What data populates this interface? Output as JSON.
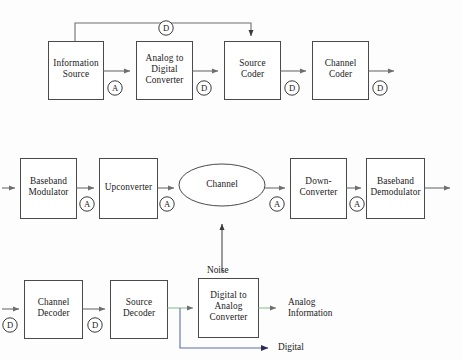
{
  "diagram": {
    "background_color": "#fdfdfd",
    "line_color": "#6e6e6e",
    "box_border_color": "#4a4a4a",
    "text_color": "#1a1a1a",
    "accent_green": "#8fbf96",
    "accent_blue": "#5a6fa8",
    "rows": [
      {
        "name": "transmitter-row",
        "blocks": [
          {
            "id": "information-source",
            "label": "Information\nSource",
            "line1": "Information",
            "line2": "Source",
            "shape": "rect"
          },
          {
            "id": "analog-to-digital-converter",
            "label": "Analog to\nDigital\nConverter",
            "line1": "Analog to",
            "line2": "Digital",
            "line3": "Converter",
            "shape": "rect"
          },
          {
            "id": "source-coder",
            "label": "Source\nCoder",
            "line1": "Source",
            "line2": "Coder",
            "shape": "rect"
          },
          {
            "id": "channel-coder",
            "label": "Channel\nCoder",
            "line1": "Channel",
            "line2": "Coder",
            "shape": "rect"
          }
        ]
      },
      {
        "name": "channel-row",
        "blocks": [
          {
            "id": "baseband-modulator",
            "label": "Baseband\nModulator",
            "line1": "Baseband",
            "line2": "Modulator",
            "shape": "rect"
          },
          {
            "id": "upconverter",
            "label": "Upconverter",
            "line1": "Upconverter",
            "shape": "rect"
          },
          {
            "id": "channel",
            "label": "Channel",
            "line1": "Channel",
            "shape": "ellipse"
          },
          {
            "id": "down-converter",
            "label": "Down-\nConverter",
            "line1": "Down-",
            "line2": "Converter",
            "shape": "rect"
          },
          {
            "id": "baseband-demodulator",
            "label": "Baseband\nDemodulator",
            "line1": "Baseband",
            "line2": "Demodulator",
            "shape": "rect"
          }
        ]
      },
      {
        "name": "receiver-row",
        "blocks": [
          {
            "id": "channel-decoder",
            "label": "Channel\nDecoder",
            "line1": "Channel",
            "line2": "Decoder",
            "shape": "rect"
          },
          {
            "id": "source-decoder",
            "label": "Source\nDecoder",
            "line1": "Source",
            "line2": "Decoder",
            "shape": "rect"
          },
          {
            "id": "digital-to-analog-converter",
            "label": "Digital to\nAnalog\nConverter",
            "line1": "Digital to",
            "line2": "Analog",
            "line3": "Converter",
            "shape": "rect"
          }
        ]
      }
    ],
    "signal_tags": [
      {
        "id": "tag-feedback-d",
        "text": "D",
        "meaning": "digital-signal"
      },
      {
        "id": "tag-info-source-out-a",
        "text": "A",
        "meaning": "analog-signal"
      },
      {
        "id": "tag-adc-out-d",
        "text": "D",
        "meaning": "digital-signal"
      },
      {
        "id": "tag-source-coder-out-d",
        "text": "D",
        "meaning": "digital-signal"
      },
      {
        "id": "tag-channel-coder-out-d",
        "text": "D",
        "meaning": "digital-signal"
      },
      {
        "id": "tag-baseband-mod-out-a",
        "text": "A",
        "meaning": "analog-signal"
      },
      {
        "id": "tag-upconverter-out-a",
        "text": "A",
        "meaning": "analog-signal"
      },
      {
        "id": "tag-channel-out-a",
        "text": "A",
        "meaning": "analog-signal"
      },
      {
        "id": "tag-downconverter-out-a",
        "text": "A",
        "meaning": "analog-signal"
      },
      {
        "id": "tag-channel-decoder-in-d",
        "text": "D",
        "meaning": "digital-signal"
      },
      {
        "id": "tag-channel-decoder-out-d",
        "text": "D",
        "meaning": "digital-signal"
      }
    ],
    "free_labels": [
      {
        "id": "noise-label",
        "text": "Noise"
      },
      {
        "id": "analog-information-label",
        "line1": "Analog",
        "line2": "Information"
      },
      {
        "id": "digital-label",
        "text": "Digital"
      }
    ]
  }
}
